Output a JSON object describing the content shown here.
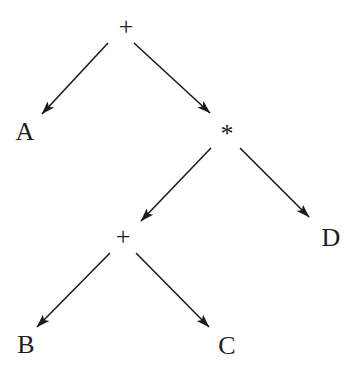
{
  "diagram": {
    "type": "binary-expression-tree",
    "background_color": "#ffffff",
    "line_color": "#1c1c1c",
    "text_color": "#1c1c1c",
    "nodes": [
      {
        "id": "plus-root",
        "label": "+",
        "x": 126,
        "y": 26
      },
      {
        "id": "a",
        "label": "A",
        "x": 25,
        "y": 131
      },
      {
        "id": "star",
        "label": "*",
        "x": 227,
        "y": 133
      },
      {
        "id": "plus-inner",
        "label": "+",
        "x": 123,
        "y": 236
      },
      {
        "id": "d",
        "label": "D",
        "x": 331,
        "y": 237
      },
      {
        "id": "b",
        "label": "B",
        "x": 26,
        "y": 344
      },
      {
        "id": "c",
        "label": "C",
        "x": 227,
        "y": 345
      }
    ],
    "edges": [
      {
        "from": "plus-root",
        "to": "a",
        "x1": 108,
        "y1": 43,
        "x2": 42,
        "y2": 114
      },
      {
        "from": "plus-root",
        "to": "star",
        "x1": 134,
        "y1": 43,
        "x2": 210,
        "y2": 113
      },
      {
        "from": "star",
        "to": "plus-inner",
        "x1": 211,
        "y1": 148,
        "x2": 141,
        "y2": 221
      },
      {
        "from": "star",
        "to": "d",
        "x1": 240,
        "y1": 148,
        "x2": 309,
        "y2": 217
      },
      {
        "from": "plus-inner",
        "to": "b",
        "x1": 110,
        "y1": 253,
        "x2": 37,
        "y2": 327
      },
      {
        "from": "plus-inner",
        "to": "c",
        "x1": 136,
        "y1": 253,
        "x2": 209,
        "y2": 327
      }
    ]
  }
}
